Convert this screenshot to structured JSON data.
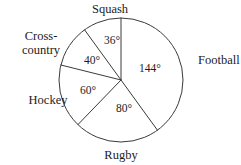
{
  "chart_data": {
    "type": "pie",
    "title": "",
    "subtitle": "",
    "xlabel": "",
    "ylabel": "",
    "units": "degrees",
    "total_degrees": 360,
    "legend_position": "outside-labels",
    "grid": false,
    "start_angle_deg": 0,
    "direction": "clockwise",
    "categories": [
      "Football",
      "Rugby",
      "Hockey",
      "Cross-country",
      "Squash"
    ],
    "values": [
      144,
      80,
      60,
      40,
      36
    ],
    "slices": [
      {
        "name": "football",
        "label": "Football",
        "value_label": "144°",
        "value": 144,
        "label_x": 198,
        "label_y": 64,
        "label_anchor": "start",
        "value_x": 150,
        "value_y": 72,
        "label_line2": ""
      },
      {
        "name": "rugby",
        "label": "Rugby",
        "value_label": "80°",
        "value": 80,
        "label_x": 121,
        "label_y": 159,
        "label_anchor": "middle",
        "value_x": 124,
        "value_y": 112,
        "label_line2": ""
      },
      {
        "name": "hockey",
        "label": "Hockey",
        "value_label": "60°",
        "value": 60,
        "label_x": 48,
        "label_y": 104,
        "label_anchor": "middle",
        "value_x": 88,
        "value_y": 94,
        "label_line2": ""
      },
      {
        "name": "cross-country",
        "label": "Cross-",
        "label_line2": "country",
        "value_label": "40°",
        "value": 40,
        "label_x": 41,
        "label_y": 40,
        "label_anchor": "middle",
        "value_x": 92,
        "value_y": 64
      },
      {
        "name": "squash",
        "label": "Squash",
        "value_label": "36°",
        "value": 36,
        "label_x": 110,
        "label_y": 13,
        "label_anchor": "middle",
        "value_x": 112,
        "value_y": 44,
        "label_line2": ""
      }
    ],
    "geometry": {
      "center_x": 121,
      "center_y": 80,
      "radius": 62
    },
    "colors": {
      "stroke": "#3a3a3a",
      "text": "#1c1c1c",
      "background": "#ffffff",
      "fill": "#ffffff"
    }
  }
}
